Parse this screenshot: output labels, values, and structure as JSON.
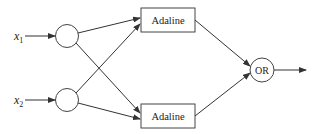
{
  "diagram": {
    "type": "neural-network",
    "inputs": [
      {
        "symbol": "x",
        "subscript": "1"
      },
      {
        "symbol": "x",
        "subscript": "2"
      }
    ],
    "hidden_units": [
      {
        "label": "Adaline"
      },
      {
        "label": "Adaline"
      }
    ],
    "output_unit": {
      "label": "OR"
    },
    "colors": {
      "stroke": "#333333",
      "background": "#ffffff"
    }
  }
}
